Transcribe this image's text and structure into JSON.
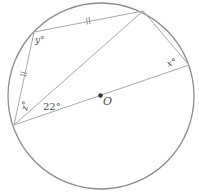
{
  "diagram": {
    "type": "circle-geometry",
    "center_label": "O",
    "angles": {
      "y": "y°",
      "z": "z°",
      "x": "x°",
      "given": "22°"
    },
    "equal_segment_marks": [
      "AB",
      "BC"
    ],
    "colors": {
      "circle": "#8a8a8a",
      "lines": "#a8a8a8",
      "text": "#4a4a4a",
      "center_dot": "#333333"
    }
  }
}
